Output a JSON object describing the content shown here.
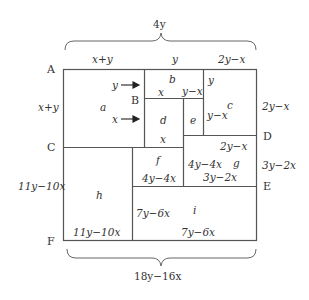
{
  "top_brace": {
    "label": "4y"
  },
  "bottom_brace": {
    "label": "18y−16x"
  },
  "top_labels": {
    "left": "x+y",
    "middle": "y",
    "right": "2y−x"
  },
  "points": {
    "A": "A",
    "B": "B",
    "C": "C",
    "D": "D",
    "E": "E",
    "F": "F"
  },
  "left_labels": {
    "ac": "x+y",
    "cf": "11y−10x"
  },
  "right_labels": {
    "ad": "2y−x",
    "de": "3y−2x"
  },
  "regions": {
    "a": {
      "name": "a",
      "arrow_top": "y",
      "arrow_bottom": "x"
    },
    "b": {
      "name": "b",
      "bottom_left": "x",
      "bottom_right": "y−x"
    },
    "c": {
      "name": "c",
      "top": "y",
      "left": "y−x"
    },
    "d": {
      "name": "d",
      "bottom": "x"
    },
    "e": {
      "name": "e"
    },
    "f": {
      "name": "f",
      "bottom": "4y−4x"
    },
    "g": {
      "name": "g",
      "top": "2y−x",
      "left": "4y−4x",
      "bottom": "3y−2x"
    },
    "h": {
      "name": "h",
      "bottom": "11y−10x"
    },
    "i": {
      "name": "i",
      "left": "7y−6x",
      "bottom": "7y−6x"
    }
  }
}
